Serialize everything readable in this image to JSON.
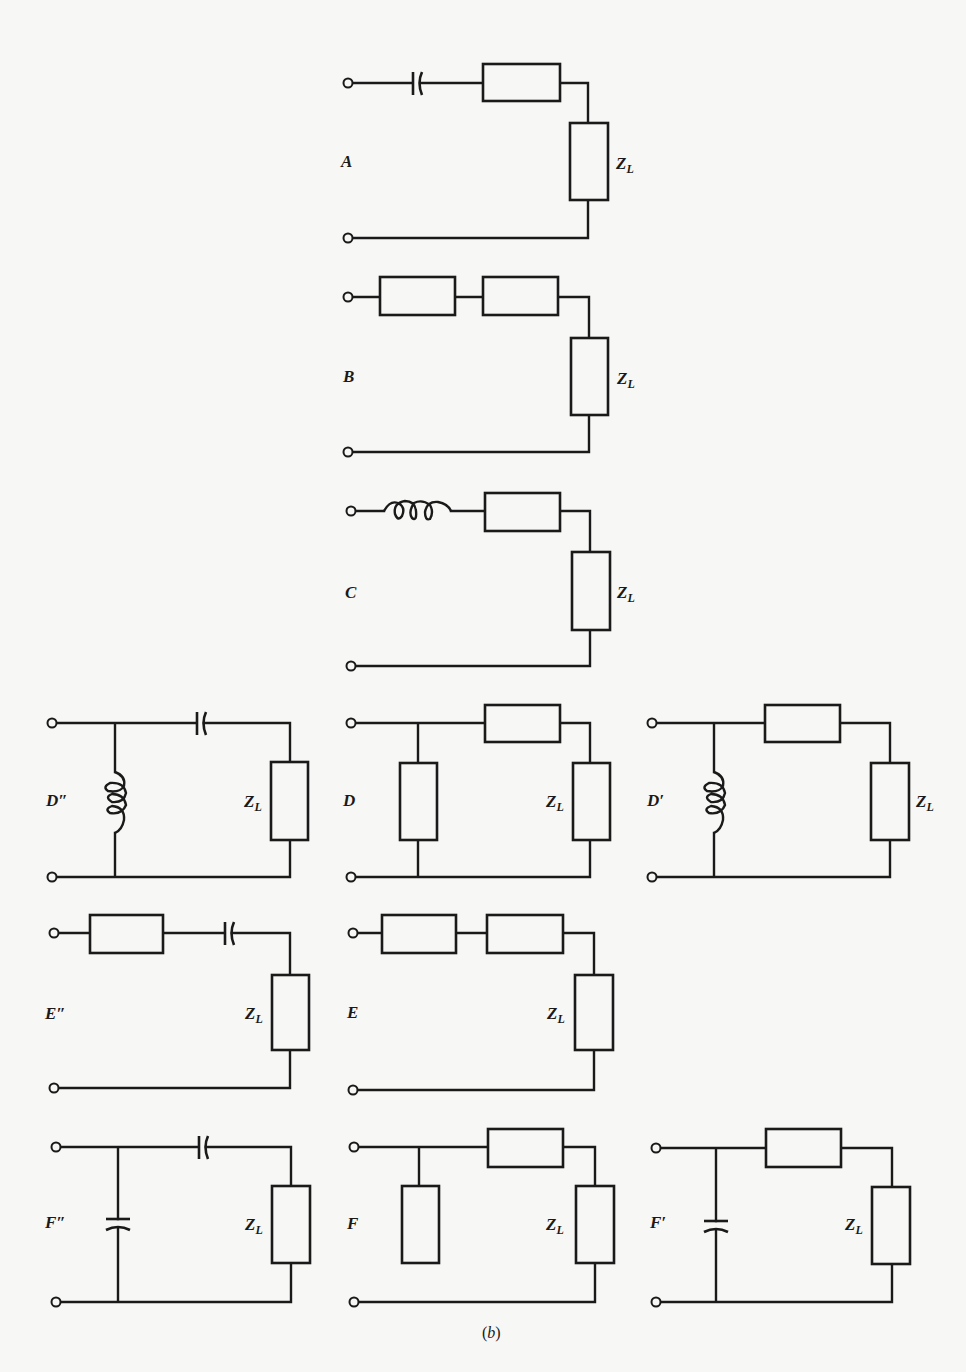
{
  "figure": {
    "caption_open": "(",
    "caption_letter": "b",
    "caption_close": ")",
    "load_label_main": "Z",
    "load_label_sub": "L",
    "colors": {
      "ink": "#1a1a1a",
      "paper": "#f7f7f5"
    }
  },
  "circuits": [
    {
      "id": "A",
      "label": "A",
      "topology": "series",
      "series_elements": [
        "capacitor",
        "impedance"
      ],
      "shunt_element": null,
      "load": "Z_L"
    },
    {
      "id": "B",
      "label": "B",
      "topology": "series",
      "series_elements": [
        "impedance",
        "impedance"
      ],
      "shunt_element": null,
      "load": "Z_L"
    },
    {
      "id": "C",
      "label": "C",
      "topology": "series",
      "series_elements": [
        "inductor",
        "impedance"
      ],
      "shunt_element": null,
      "load": "Z_L"
    },
    {
      "id": "D2",
      "label": "D″",
      "topology": "shunt-series",
      "shunt_element": "inductor",
      "series_elements": [
        "capacitor"
      ],
      "load": "Z_L"
    },
    {
      "id": "D",
      "label": "D",
      "topology": "shunt-series",
      "shunt_element": "impedance",
      "series_elements": [
        "impedance"
      ],
      "load": "Z_L"
    },
    {
      "id": "D1",
      "label": "D′",
      "topology": "shunt-series",
      "shunt_element": "inductor",
      "series_elements": [
        "impedance"
      ],
      "load": "Z_L"
    },
    {
      "id": "E2",
      "label": "E″",
      "topology": "series",
      "series_elements": [
        "impedance",
        "capacitor"
      ],
      "shunt_element": null,
      "load": "Z_L"
    },
    {
      "id": "E",
      "label": "E",
      "topology": "series",
      "series_elements": [
        "impedance",
        "impedance"
      ],
      "shunt_element": null,
      "load": "Z_L"
    },
    {
      "id": "F2",
      "label": "F″",
      "topology": "shunt-series",
      "shunt_element": "capacitor",
      "series_elements": [
        "capacitor"
      ],
      "load": "Z_L"
    },
    {
      "id": "F",
      "label": "F",
      "topology": "shunt-series",
      "shunt_element": "impedance (open at bottom)",
      "series_elements": [
        "impedance"
      ],
      "load": "Z_L"
    },
    {
      "id": "F1",
      "label": "F′",
      "topology": "shunt-series",
      "shunt_element": "capacitor",
      "series_elements": [
        "impedance"
      ],
      "load": "Z_L"
    }
  ]
}
